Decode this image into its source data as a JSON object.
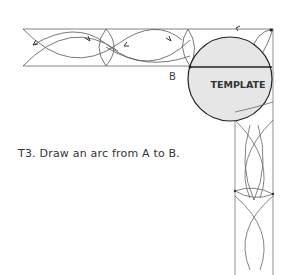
{
  "diagram": {
    "template_label": "TEMPLATE",
    "point_label_b": "B",
    "caption": "T3. Draw an arc from A to B.",
    "colors": {
      "line": "#555555",
      "template_fill": "#e6e6e6",
      "template_stroke": "#222222"
    }
  }
}
